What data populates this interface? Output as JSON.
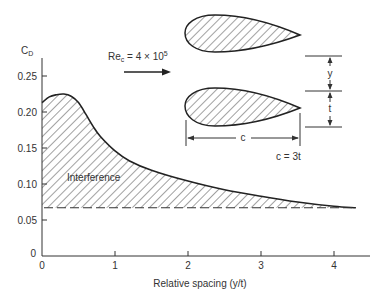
{
  "chart_data": {
    "type": "area",
    "title": "",
    "xlabel": "Relative spacing (y/t)",
    "ylabel": "C_D",
    "ylabel_main": "C",
    "ylabel_sub": "D",
    "xlim": [
      0,
      4.5
    ],
    "ylim": [
      0,
      0.27
    ],
    "x_ticks": [
      "0",
      "1",
      "2",
      "3",
      "4"
    ],
    "y_ticks": [
      "0",
      "0.05",
      "0.10",
      "0.15",
      "0.20",
      "0.25"
    ],
    "grid": false,
    "series": [
      {
        "name": "Drag coefficient vs spacing",
        "x": [
          0.0,
          0.1,
          0.2,
          0.3,
          0.4,
          0.5,
          0.6,
          0.7,
          0.8,
          1.0,
          1.2,
          1.5,
          2.0,
          2.5,
          3.0,
          3.5,
          4.0,
          4.3
        ],
        "y": [
          0.213,
          0.221,
          0.224,
          0.225,
          0.222,
          0.213,
          0.197,
          0.18,
          0.166,
          0.146,
          0.132,
          0.119,
          0.104,
          0.092,
          0.083,
          0.075,
          0.069,
          0.067
        ]
      },
      {
        "name": "Isolated airfoil baseline",
        "style": "dashed",
        "x": [
          0.0,
          4.3
        ],
        "y": [
          0.067,
          0.067
        ]
      }
    ],
    "annotations": {
      "region_label": "Interference",
      "reynolds_main": "Re",
      "reynolds_sub": "c",
      "reynolds_value": " = 4 × 10",
      "reynolds_exp": "5",
      "dim_y": "y",
      "dim_t": "t",
      "dim_c": "c",
      "relation": "c = 3t"
    }
  }
}
